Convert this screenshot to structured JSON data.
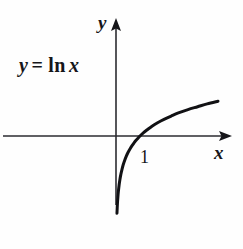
{
  "figure": {
    "background_color": "#fefefe",
    "ink_color": "#16161a",
    "width": 243,
    "height": 249
  },
  "labels": {
    "y_axis": "y",
    "x_axis": "x",
    "tick_one": "1",
    "equation": {
      "lhs": "y",
      "operator": "=",
      "function": "ln",
      "argument": "x",
      "full_text": "y = ln x"
    }
  },
  "chart_data": {
    "type": "line",
    "title": "",
    "subtitle": "",
    "xlabel": "x",
    "ylabel": "y",
    "function": "y = ln x",
    "annotations": [
      {
        "text": "y = ln x",
        "x_px": 19,
        "y_px": 55
      },
      {
        "text": "1",
        "x_value": 1,
        "y_value": 0,
        "note": "x-intercept tick label"
      }
    ],
    "legend": [],
    "legend_position": "none",
    "grid": false,
    "axes": {
      "x_axis_y_px": 136,
      "y_axis_x_px": 116,
      "origin_px": [
        116,
        136
      ],
      "px_per_unit_x": 24,
      "px_per_unit_y": 24,
      "x_arrow_tip_px": [
        232,
        136
      ],
      "y_arrow_tip_px": [
        116,
        18
      ],
      "x_axis_left_px": 3,
      "y_axis_bottom_px": 205,
      "xlim": [
        -4.7,
        4.8
      ],
      "ylim": [
        -4.7,
        4.9
      ]
    },
    "x_intercept": 1,
    "ticks": {
      "x": [
        1
      ],
      "y": []
    },
    "x": [
      0.04,
      0.06,
      0.08,
      0.1,
      0.13,
      0.16,
      0.2,
      0.25,
      0.3,
      0.36,
      0.43,
      0.5,
      0.6,
      0.7,
      0.8,
      0.9,
      1.0,
      1.15,
      1.3,
      1.5,
      1.75,
      2.0,
      2.3,
      2.6,
      3.0,
      3.4,
      3.8,
      4.25
    ],
    "values": [
      -3.22,
      -2.81,
      -2.53,
      -2.3,
      -2.04,
      -1.83,
      -1.61,
      -1.39,
      -1.2,
      -1.02,
      -0.84,
      -0.69,
      -0.51,
      -0.36,
      -0.22,
      -0.11,
      0.0,
      0.14,
      0.26,
      0.41,
      0.56,
      0.69,
      0.83,
      0.96,
      1.1,
      1.22,
      1.34,
      1.45
    ],
    "curve_endpoints_px": {
      "start": [
        119,
        249
      ],
      "end": [
        218,
        100
      ]
    },
    "curve_stroke_width_px": 3,
    "axis_stroke_width_px": 1.6
  }
}
